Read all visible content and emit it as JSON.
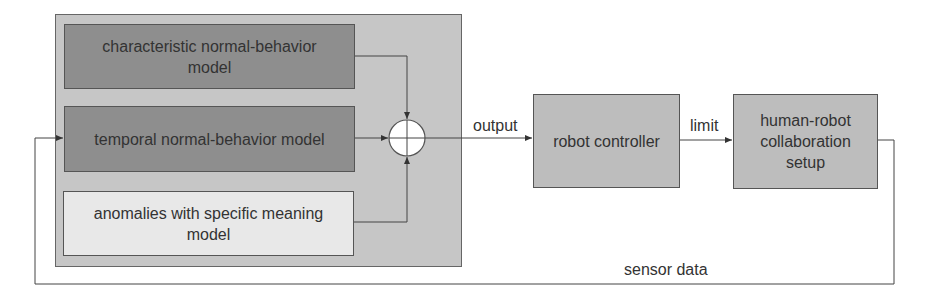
{
  "diagram": {
    "model_group": {
      "blocks": [
        {
          "label": "characteristic normal-behavior model",
          "fill": "#8e8e8e"
        },
        {
          "label": "temporal normal-behavior model",
          "fill": "#8e8e8e"
        },
        {
          "label": "anomalies with specific meaning model",
          "fill": "#e8e8e8"
        }
      ],
      "fill": "#c6c6c6",
      "combiner": "summing-junction"
    },
    "blocks": [
      {
        "label": "robot controller",
        "fill": "#bdbdbd"
      },
      {
        "label": "human-robot collaboration setup",
        "fill": "#bdbdbd"
      }
    ],
    "edges": [
      {
        "from": "characteristic normal-behavior model",
        "to": "summing-junction",
        "label": ""
      },
      {
        "from": "temporal normal-behavior model",
        "to": "summing-junction",
        "label": ""
      },
      {
        "from": "anomalies with specific meaning model",
        "to": "summing-junction",
        "label": ""
      },
      {
        "from": "summing-junction",
        "to": "robot controller",
        "label": "output"
      },
      {
        "from": "robot controller",
        "to": "human-robot collaboration setup",
        "label": "limit"
      },
      {
        "from": "human-robot collaboration setup",
        "to": "temporal normal-behavior model",
        "label": "sensor data"
      }
    ],
    "labels": {
      "output": "output",
      "limit": "limit",
      "sensor_data": "sensor data"
    }
  }
}
